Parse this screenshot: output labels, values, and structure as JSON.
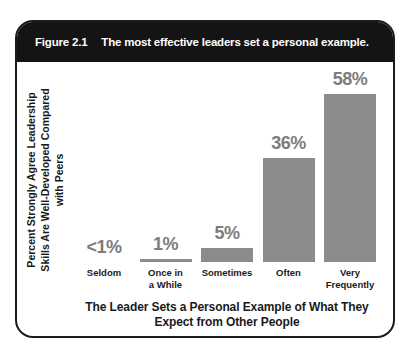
{
  "figure": {
    "label": "Figure 2.1",
    "title": "The most effective leaders set a personal example."
  },
  "chart_data": {
    "type": "bar",
    "categories": [
      "Seldom",
      "Once in\na While",
      "Sometimes",
      "Often",
      "Very\nFrequently"
    ],
    "display_values": [
      "<1%",
      "1%",
      "5%",
      "36%",
      "58%"
    ],
    "values": [
      0,
      1,
      5,
      36,
      58
    ],
    "ylim": [
      0,
      60
    ],
    "grid": false,
    "legend": "none",
    "title": "",
    "xlabel": "The Leader Sets a Personal Example of What They\nExpect from Other People",
    "ylabel": "Percent Strongly Agree Leadership\nSkills Are Well-Developed Compared\nwith Peers",
    "bar_color": "#8b8b8b",
    "value_label_color": "#7d7d7d"
  },
  "colors": {
    "header_bg": "#141414",
    "header_text": "#ffffff",
    "border": "#1c1c1c",
    "background": "#ffffff",
    "category_text": "#1a1a1a"
  }
}
